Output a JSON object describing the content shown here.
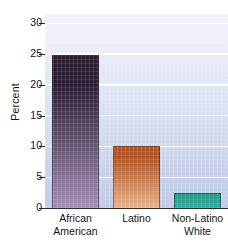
{
  "chart_data": {
    "type": "bar",
    "title": "",
    "subtitle": "",
    "xlabel": "",
    "ylabel": "Percent",
    "categories": [
      "African American",
      "Latino",
      "Non-Latino White"
    ],
    "category_lines": [
      [
        "African",
        "American"
      ],
      [
        "Latino"
      ],
      [
        "Non-Latino",
        "White"
      ]
    ],
    "values": [
      24.8,
      10.0,
      2.4
    ],
    "ylim": [
      0,
      31.5
    ],
    "yticks": [
      0,
      5,
      10,
      15,
      20,
      25,
      30
    ],
    "ytick_labels": [
      "0",
      "5",
      "10",
      "15",
      "20",
      "25",
      "30"
    ],
    "grid": "horizontal-white",
    "legend": "none",
    "bar_colors": [
      "#2b1b33",
      "#b75321",
      "#1f9a85"
    ],
    "bar_colors_bottom": [
      "#a38fb4",
      "#e8b188",
      "#2fada0"
    ],
    "annotations": []
  },
  "figure": {
    "background_color": "#ffffff",
    "plot_background_top": "#f2f4fb",
    "plot_background_bottom": "#c0cbe7",
    "axis_color": "#2b2b2b",
    "text_color": "#141414",
    "gridline_color": "#ffffff"
  }
}
